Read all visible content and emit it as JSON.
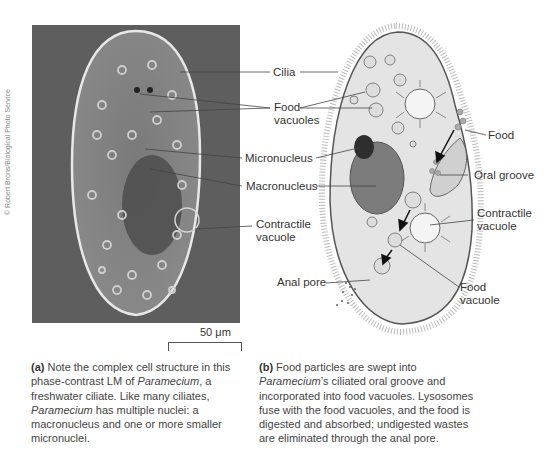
{
  "figure": {
    "panel_a": {
      "photo_credit": "© Robert Brons/Biological Photo Service",
      "scale_bar_label": "50 μm",
      "caption_tag": "(a)",
      "caption_parts": [
        "Note the complex cell structure in this phase-contrast LM of ",
        "Paramecium",
        ", a freshwater ciliate. Like many ciliates, ",
        "Paramecium",
        " has multiple nuclei: a macronucleus and one or more smaller micronuclei."
      ]
    },
    "panel_b": {
      "caption_tag": "(b)",
      "caption_parts": [
        "Food particles are swept into ",
        "Paramecium",
        "’s ciliated oral groove and incorporated into food vacuoles. Lysosomes fuse with the food vacuoles, and the food is digested and absorbed; undigested wastes are eliminated through the anal pore."
      ]
    },
    "shared_labels": {
      "cilia": "Cilia",
      "food_vacuoles_1": "Food",
      "food_vacuoles_2": "vacuoles",
      "micronucleus": "Micronucleus",
      "macronucleus": "Macronucleus",
      "contractile_1": "Contractile",
      "contractile_2": "vacuole"
    },
    "right_labels": {
      "food": "Food",
      "oral_groove": "Oral groove",
      "contractile_1": "Contractile",
      "contractile_2": "vacuole",
      "anal_pore": "Anal pore",
      "food_vacuole_1": "Food",
      "food_vacuole_2": "vacuole"
    },
    "colors": {
      "photo_bg": "#5e5e5e",
      "cell_fill": "#e6e6e6",
      "macronucleus": "#777777",
      "micronucleus": "#2e2e2e"
    }
  }
}
